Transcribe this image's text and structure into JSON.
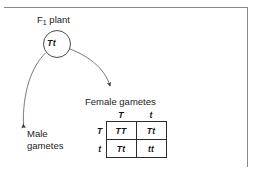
{
  "figure": {
    "title_label": "F",
    "title_sub": "1",
    "title_suffix": " plant"
  },
  "parent": {
    "genotype": "Tt",
    "shape": "circle"
  },
  "labels": {
    "female_gametes": "Female gametes",
    "male_gametes": "Male gametes"
  },
  "punnett": {
    "column_headers": [
      "T",
      "t"
    ],
    "row_headers": [
      "T",
      "t"
    ],
    "cells": [
      [
        {
          "text": "TT",
          "recessive": false
        },
        {
          "text": "Tt",
          "recessive": false
        }
      ],
      [
        {
          "text": "Tt",
          "recessive": false
        },
        {
          "text": "tt",
          "recessive": true
        }
      ]
    ]
  },
  "arrows": {
    "male_arrow_name": "male-gametes-arrow",
    "female_arrow_name": "female-gametes-arrow"
  },
  "colors": {
    "stroke": "#4a4a4a",
    "text": "#1b1b1b",
    "grid": "#2b2b2b",
    "recessive_text": "#b9b9b9",
    "frame": "#8a8a8a"
  }
}
